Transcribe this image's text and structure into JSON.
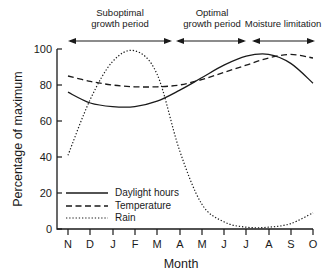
{
  "chart_data": {
    "type": "line",
    "title": "",
    "xlabel": "Month",
    "ylabel": "Percentage of maximum",
    "ylim": [
      0,
      100
    ],
    "yticks": [
      0,
      20,
      40,
      60,
      80,
      100
    ],
    "grid": false,
    "legend_position": "inside-lower-left",
    "categories": [
      "N",
      "D",
      "J",
      "F",
      "M",
      "A",
      "M",
      "J",
      "J",
      "A",
      "S",
      "O"
    ],
    "series": [
      {
        "name": "Daylight hours",
        "style": "solid",
        "values": [
          76,
          70,
          68,
          68,
          71,
          77,
          84,
          91,
          96,
          97,
          92,
          81
        ]
      },
      {
        "name": "Temperature",
        "style": "dashed",
        "values": [
          85,
          82,
          80,
          79,
          79,
          80,
          83,
          87,
          91,
          95,
          97,
          95
        ]
      },
      {
        "name": "Rain",
        "style": "dotted",
        "values": [
          41,
          72,
          93,
          99,
          86,
          44,
          14,
          4,
          1,
          1,
          3,
          9
        ]
      }
    ],
    "annotations": [
      {
        "label": "Suboptimal growth period",
        "line1": "Suboptimal",
        "line2": "growth period",
        "from": "D",
        "to": "M"
      },
      {
        "label": "Optimal growth period",
        "line1": "Optimal",
        "line2": "growth period",
        "from": "M",
        "to": "J"
      },
      {
        "label": "Moisture limitation",
        "line1": "Moisture limitation",
        "line2": "",
        "from": "J",
        "to": "O"
      }
    ]
  },
  "axes": {
    "ylabel": "Percentage of maximum",
    "xlabel": "Month",
    "yticks": [
      "0",
      "20",
      "40",
      "60",
      "80",
      "100"
    ],
    "xticks": [
      "N",
      "D",
      "J",
      "F",
      "M",
      "A",
      "M",
      "J",
      "J",
      "A",
      "S",
      "O"
    ]
  },
  "periods": [
    {
      "line1": "Suboptimal",
      "line2": "growth period"
    },
    {
      "line1": "Optimal",
      "line2": "growth period"
    },
    {
      "line1": "Moisture limitation",
      "line2": ""
    }
  ],
  "legend": {
    "items": [
      {
        "label": "Daylight hours"
      },
      {
        "label": "Temperature"
      },
      {
        "label": "Rain"
      }
    ]
  }
}
